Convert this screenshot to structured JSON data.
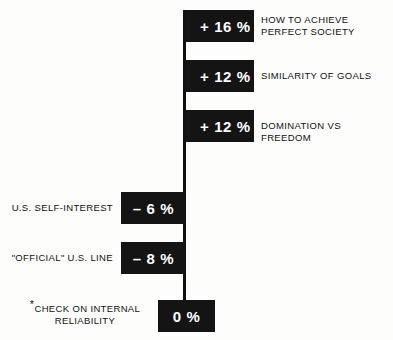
{
  "chart_data": {
    "type": "bar",
    "orientation": "horizontal",
    "title": "",
    "subtitle": "",
    "xlabel": "",
    "ylabel": "",
    "grid": false,
    "legend": null,
    "zero_line": 0,
    "unit": "%",
    "xlim": [
      -10,
      18
    ],
    "categories": [
      "HOW TO ACHIEVE\nPERFECT SOCIETY",
      "SIMILARITY OF GOALS",
      "DOMINATION VS FREEDOM",
      "U.S. SELF-INTEREST",
      "\"OFFICIAL\" U.S. LINE",
      "*CHECK ON INTERNAL\nRELIABILITY"
    ],
    "values": [
      16,
      12,
      12,
      -6,
      -8,
      0
    ],
    "value_labels": [
      "+ 16 %",
      "+ 12 %",
      "+ 12 %",
      "– 6 %",
      "– 8 %",
      "0 %"
    ],
    "label_side": [
      "right",
      "right",
      "right",
      "left",
      "left",
      "left"
    ],
    "annotations": [
      "*CHECK ON INTERNAL RELIABILITY"
    ]
  },
  "bars": [
    {
      "name": "bar-how-to-achieve-perfect-society",
      "label": "HOW TO ACHIEVE\nPERFECT SOCIETY",
      "value_label": "+ 16 %",
      "value": 16,
      "side": "pos",
      "label_side": "right",
      "style": {
        "left": 185,
        "top": 10,
        "width": 69,
        "height": 32
      },
      "label_style": {
        "left": 261,
        "top": 14,
        "width": 128
      }
    },
    {
      "name": "bar-similarity-of-goals",
      "label": "SIMILARITY OF GOALS",
      "value_label": "+ 12 %",
      "value": 12,
      "side": "pos",
      "label_side": "right",
      "style": {
        "left": 185,
        "top": 60,
        "width": 69,
        "height": 32
      },
      "label_style": {
        "left": 261,
        "top": 70,
        "width": 128
      }
    },
    {
      "name": "bar-domination-vs-freedom",
      "label": "DOMINATION VS FREEDOM",
      "value_label": "+ 12 %",
      "value": 12,
      "side": "pos",
      "label_side": "right",
      "style": {
        "left": 185,
        "top": 110,
        "width": 69,
        "height": 32
      },
      "label_style": {
        "left": 261,
        "top": 120,
        "width": 132
      }
    },
    {
      "name": "bar-us-self-interest",
      "label": "U.S. SELF-INTEREST",
      "value_label": "– 6 %",
      "value": -6,
      "side": "neg",
      "label_side": "left",
      "style": {
        "left": 121,
        "top": 192,
        "width": 65,
        "height": 32
      },
      "label_style": {
        "left": 5,
        "top": 202,
        "width": 108
      }
    },
    {
      "name": "bar-official-us-line",
      "label": "\"OFFICIAL\" U.S. LINE",
      "value_label": "– 8 %",
      "value": -8,
      "side": "neg",
      "label_side": "left",
      "style": {
        "left": 121,
        "top": 242,
        "width": 65,
        "height": 32
      },
      "label_style": {
        "left": 5,
        "top": 252,
        "width": 108
      }
    },
    {
      "name": "bar-check-on-internal-reliability",
      "label": "CHECK ON INTERNAL\nRELIABILITY",
      "label_prefix": "*",
      "value_label": "0 %",
      "value": 0,
      "side": "zero",
      "label_side": "left",
      "style": {
        "left": 158,
        "top": 300,
        "width": 57,
        "height": 32
      },
      "label_style": {
        "left": 20,
        "top": 303,
        "width": 130
      }
    }
  ],
  "axis": {
    "name": "zero-axis",
    "style": {
      "left": 183,
      "top": 10,
      "width": 3,
      "height": 322
    }
  },
  "colors": {
    "bar_fill": "#141414",
    "bar_text": "#ffffff",
    "label_text": "#111111",
    "background": "#fdfdfb",
    "axis": "#111111"
  }
}
